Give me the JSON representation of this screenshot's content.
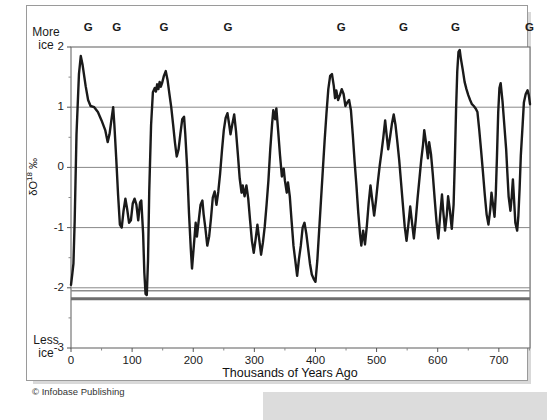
{
  "figure": {
    "credit": "© Infobase Publishing",
    "corner_labels": {
      "top_left_line1": "More",
      "top_left_line2": "ice",
      "bottom_left_line1": "Less",
      "bottom_left_line2": "ice"
    }
  },
  "chart_data": {
    "type": "line",
    "title": "",
    "xlabel": "Thousands of Years Ago",
    "ylabel": "δO18 ‰",
    "ylabel_parts": {
      "delta": "δ",
      "element": "O",
      "mass": "18",
      "unit": "‰"
    },
    "xlim": [
      0,
      751
    ],
    "ylim": [
      -3,
      2
    ],
    "xticks": [
      0,
      100,
      200,
      300,
      400,
      500,
      600,
      700
    ],
    "xtick_labels": [
      "0",
      "100",
      "200",
      "300",
      "400",
      "500",
      "600",
      "700"
    ],
    "xminor_ticks": [
      50,
      150,
      250,
      350,
      450,
      550,
      650,
      750
    ],
    "yticks": [
      2,
      1,
      0,
      -1,
      -2,
      -3
    ],
    "ytick_labels": [
      "2",
      "1",
      "0",
      "-1",
      "-2",
      "-3"
    ],
    "yminor_ticks": [
      1.5,
      0.5,
      -0.5,
      -1.5,
      -2.5
    ],
    "grid": true,
    "grid_color": "#888888",
    "line_color": "#1a1a1a",
    "line_width": 2.4,
    "reference_lines": [
      {
        "value": -2.05,
        "color": "#8c8c8c",
        "width": 1.6
      },
      {
        "value": -2.18,
        "color": "#6e6e6e",
        "width": 3.0
      }
    ],
    "glacial_markers": {
      "symbol": "G",
      "label": "G",
      "positions_ka": [
        28,
        75,
        152,
        257,
        442,
        544,
        629,
        750
      ]
    },
    "series": [
      {
        "name": "δO18 record",
        "points": [
          [
            0,
            -1.95
          ],
          [
            2,
            -1.78
          ],
          [
            4,
            -1.6
          ],
          [
            6,
            -0.9
          ],
          [
            9,
            0.55
          ],
          [
            13,
            1.55
          ],
          [
            16,
            1.85
          ],
          [
            19,
            1.7
          ],
          [
            24,
            1.35
          ],
          [
            28,
            1.12
          ],
          [
            32,
            1.02
          ],
          [
            38,
            1.0
          ],
          [
            44,
            0.92
          ],
          [
            50,
            0.78
          ],
          [
            56,
            0.62
          ],
          [
            60,
            0.42
          ],
          [
            63,
            0.55
          ],
          [
            66,
            0.78
          ],
          [
            69,
            1.0
          ],
          [
            71,
            0.7
          ],
          [
            74,
            0.15
          ],
          [
            77,
            -0.45
          ],
          [
            80,
            -0.95
          ],
          [
            83,
            -1.0
          ],
          [
            86,
            -0.72
          ],
          [
            89,
            -0.52
          ],
          [
            92,
            -0.7
          ],
          [
            95,
            -0.92
          ],
          [
            98,
            -0.88
          ],
          [
            101,
            -0.6
          ],
          [
            104,
            -0.52
          ],
          [
            107,
            -0.62
          ],
          [
            110,
            -0.88
          ],
          [
            113,
            -0.58
          ],
          [
            115,
            -0.55
          ],
          [
            118,
            -1.1
          ],
          [
            120,
            -1.75
          ],
          [
            122,
            -2.1
          ],
          [
            124,
            -2.12
          ],
          [
            126,
            -1.55
          ],
          [
            128,
            -0.4
          ],
          [
            131,
            0.7
          ],
          [
            134,
            1.25
          ],
          [
            137,
            1.32
          ],
          [
            139,
            1.26
          ],
          [
            141,
            1.38
          ],
          [
            143,
            1.3
          ],
          [
            145,
            1.42
          ],
          [
            147,
            1.34
          ],
          [
            149,
            1.4
          ],
          [
            152,
            1.52
          ],
          [
            155,
            1.6
          ],
          [
            158,
            1.45
          ],
          [
            161,
            1.22
          ],
          [
            164,
            1.0
          ],
          [
            167,
            0.72
          ],
          [
            170,
            0.42
          ],
          [
            173,
            0.18
          ],
          [
            176,
            0.3
          ],
          [
            179,
            0.56
          ],
          [
            182,
            0.8
          ],
          [
            185,
            0.84
          ],
          [
            187,
            0.55
          ],
          [
            190,
            0.0
          ],
          [
            193,
            -0.75
          ],
          [
            196,
            -1.35
          ],
          [
            198,
            -1.68
          ],
          [
            201,
            -1.3
          ],
          [
            204,
            -0.92
          ],
          [
            206,
            -1.15
          ],
          [
            209,
            -0.88
          ],
          [
            212,
            -0.62
          ],
          [
            215,
            -0.55
          ],
          [
            217,
            -0.78
          ],
          [
            220,
            -1.02
          ],
          [
            223,
            -1.3
          ],
          [
            226,
            -1.15
          ],
          [
            229,
            -0.85
          ],
          [
            232,
            -0.5
          ],
          [
            235,
            -0.4
          ],
          [
            238,
            -0.62
          ],
          [
            241,
            -0.4
          ],
          [
            244,
            -0.1
          ],
          [
            247,
            0.28
          ],
          [
            250,
            0.62
          ],
          [
            253,
            0.82
          ],
          [
            256,
            0.9
          ],
          [
            259,
            0.7
          ],
          [
            261,
            0.55
          ],
          [
            264,
            0.72
          ],
          [
            267,
            0.88
          ],
          [
            270,
            0.6
          ],
          [
            273,
            0.22
          ],
          [
            276,
            -0.18
          ],
          [
            279,
            -0.42
          ],
          [
            281,
            -0.3
          ],
          [
            284,
            -0.48
          ],
          [
            287,
            -0.3
          ],
          [
            290,
            -0.52
          ],
          [
            293,
            -0.88
          ],
          [
            296,
            -1.22
          ],
          [
            299,
            -1.42
          ],
          [
            302,
            -1.2
          ],
          [
            305,
            -0.95
          ],
          [
            308,
            -1.2
          ],
          [
            311,
            -1.45
          ],
          [
            314,
            -1.25
          ],
          [
            317,
            -0.98
          ],
          [
            320,
            -0.62
          ],
          [
            323,
            -0.22
          ],
          [
            326,
            0.3
          ],
          [
            329,
            0.72
          ],
          [
            331,
            0.95
          ],
          [
            334,
            0.8
          ],
          [
            336,
            0.98
          ],
          [
            339,
            0.6
          ],
          [
            342,
            0.2
          ],
          [
            345,
            -0.15
          ],
          [
            348,
            -0.02
          ],
          [
            350,
            -0.22
          ],
          [
            353,
            -0.42
          ],
          [
            355,
            -0.25
          ],
          [
            358,
            -0.48
          ],
          [
            361,
            -0.9
          ],
          [
            364,
            -1.3
          ],
          [
            367,
            -1.55
          ],
          [
            370,
            -1.8
          ],
          [
            373,
            -1.52
          ],
          [
            376,
            -1.3
          ],
          [
            379,
            -1.0
          ],
          [
            382,
            -0.92
          ],
          [
            385,
            -1.1
          ],
          [
            388,
            -1.35
          ],
          [
            391,
            -1.6
          ],
          [
            394,
            -1.78
          ],
          [
            397,
            -1.85
          ],
          [
            400,
            -1.9
          ],
          [
            403,
            -1.55
          ],
          [
            406,
            -1.05
          ],
          [
            409,
            -0.55
          ],
          [
            412,
            -0.05
          ],
          [
            415,
            0.45
          ],
          [
            418,
            0.9
          ],
          [
            421,
            1.3
          ],
          [
            424,
            1.52
          ],
          [
            427,
            1.55
          ],
          [
            430,
            1.35
          ],
          [
            432,
            1.15
          ],
          [
            434,
            1.28
          ],
          [
            437,
            1.12
          ],
          [
            440,
            1.2
          ],
          [
            443,
            1.3
          ],
          [
            446,
            1.22
          ],
          [
            449,
            1.02
          ],
          [
            452,
            1.08
          ],
          [
            455,
            1.12
          ],
          [
            458,
            0.95
          ],
          [
            461,
            0.55
          ],
          [
            464,
            0.1
          ],
          [
            467,
            -0.3
          ],
          [
            470,
            -0.75
          ],
          [
            473,
            -1.12
          ],
          [
            475,
            -1.3
          ],
          [
            478,
            -1.05
          ],
          [
            481,
            -1.28
          ],
          [
            484,
            -0.98
          ],
          [
            487,
            -0.6
          ],
          [
            490,
            -0.3
          ],
          [
            493,
            -0.55
          ],
          [
            496,
            -0.8
          ],
          [
            499,
            -0.55
          ],
          [
            502,
            -0.25
          ],
          [
            505,
            0.02
          ],
          [
            508,
            0.25
          ],
          [
            511,
            0.5
          ],
          [
            514,
            0.78
          ],
          [
            516,
            0.58
          ],
          [
            519,
            0.3
          ],
          [
            522,
            0.5
          ],
          [
            525,
            0.72
          ],
          [
            528,
            0.88
          ],
          [
            531,
            0.7
          ],
          [
            534,
            0.42
          ],
          [
            537,
            0.12
          ],
          [
            540,
            -0.25
          ],
          [
            543,
            -0.62
          ],
          [
            546,
            -0.98
          ],
          [
            549,
            -1.22
          ],
          [
            552,
            -0.95
          ],
          [
            555,
            -0.65
          ],
          [
            558,
            -0.92
          ],
          [
            561,
            -1.18
          ],
          [
            564,
            -0.88
          ],
          [
            567,
            -0.52
          ],
          [
            570,
            -0.2
          ],
          [
            573,
            0.12
          ],
          [
            576,
            0.38
          ],
          [
            578,
            0.62
          ],
          [
            581,
            0.4
          ],
          [
            584,
            0.15
          ],
          [
            586,
            0.42
          ],
          [
            589,
            0.22
          ],
          [
            592,
            -0.12
          ],
          [
            595,
            -0.52
          ],
          [
            598,
            -0.9
          ],
          [
            601,
            -1.18
          ],
          [
            604,
            -0.8
          ],
          [
            607,
            -0.45
          ],
          [
            609,
            -0.72
          ],
          [
            612,
            -1.05
          ],
          [
            615,
            -0.78
          ],
          [
            617,
            -0.48
          ],
          [
            620,
            -0.72
          ],
          [
            623,
            -1.02
          ],
          [
            626,
            -0.62
          ],
          [
            628,
            0.1
          ],
          [
            630,
            0.95
          ],
          [
            632,
            1.6
          ],
          [
            634,
            1.92
          ],
          [
            636,
            1.95
          ],
          [
            638,
            1.8
          ],
          [
            641,
            1.62
          ],
          [
            644,
            1.42
          ],
          [
            647,
            1.3
          ],
          [
            650,
            1.2
          ],
          [
            653,
            1.12
          ],
          [
            656,
            1.05
          ],
          [
            659,
            1.02
          ],
          [
            662,
            0.98
          ],
          [
            665,
            0.92
          ],
          [
            668,
            0.62
          ],
          [
            671,
            0.28
          ],
          [
            674,
            -0.08
          ],
          [
            677,
            -0.45
          ],
          [
            680,
            -0.78
          ],
          [
            683,
            -0.95
          ],
          [
            686,
            -0.7
          ],
          [
            688,
            -0.42
          ],
          [
            690,
            -0.58
          ],
          [
            693,
            -0.82
          ],
          [
            695,
            -0.45
          ],
          [
            697,
            0.2
          ],
          [
            699,
            0.92
          ],
          [
            701,
            1.32
          ],
          [
            703,
            1.4
          ],
          [
            706,
            1.1
          ],
          [
            709,
            0.7
          ],
          [
            712,
            0.3
          ],
          [
            714,
            -0.1
          ],
          [
            716,
            -0.48
          ],
          [
            719,
            -0.72
          ],
          [
            721,
            -0.5
          ],
          [
            723,
            -0.2
          ],
          [
            725,
            -0.55
          ],
          [
            727,
            -0.92
          ],
          [
            730,
            -1.05
          ],
          [
            732,
            -0.8
          ],
          [
            734,
            -0.35
          ],
          [
            736,
            0.2
          ],
          [
            739,
            0.72
          ],
          [
            741,
            1.08
          ],
          [
            744,
            1.22
          ],
          [
            747,
            1.28
          ],
          [
            749,
            1.2
          ],
          [
            751,
            1.05
          ]
        ]
      }
    ]
  }
}
